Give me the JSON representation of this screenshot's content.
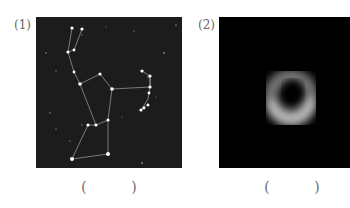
{
  "figures": [
    {
      "label": "(1)",
      "subject": "constellation star chart with connecting lines",
      "answer_blank": [
        "(",
        ")"
      ]
    },
    {
      "label": "(2)",
      "subject": "black hole ring image",
      "answer_blank": [
        "(",
        ")"
      ]
    }
  ]
}
